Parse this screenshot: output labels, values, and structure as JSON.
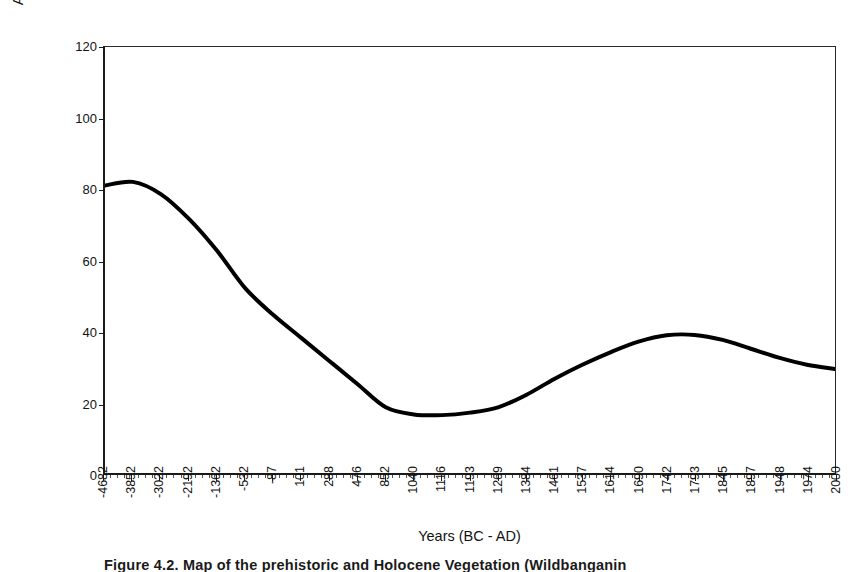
{
  "figure": {
    "caption": "Figure 4.2. Map of the prehistoric and Holocene Vegetation (Wildbanganin"
  },
  "chart_data": {
    "type": "line",
    "title": "",
    "xlabel": "Years (BC - AD)",
    "ylabel": "Arboreal/NonArboreal Pollen %",
    "ylim": [
      0,
      120
    ],
    "ytick_values": [
      0,
      20,
      40,
      60,
      80,
      100,
      120
    ],
    "ytick_labels": [
      "0",
      "20",
      "40",
      "60",
      "80",
      "100",
      "120"
    ],
    "grid": false,
    "legend": null,
    "line_color": "#000000",
    "line_width": 4,
    "categories": [
      "-4682",
      "-3852",
      "-3022",
      "-2192",
      "-1362",
      "-532",
      "-87",
      "101",
      "288",
      "476",
      "852",
      "1040",
      "1116",
      "1193",
      "1269",
      "1384",
      "1461",
      "1537",
      "1614",
      "1690",
      "1742",
      "1793",
      "1845",
      "1897",
      "1948",
      "1974",
      "2000"
    ],
    "series": [
      {
        "name": "Arboreal/NonArboreal Pollen %",
        "values": [
          81.0,
          82.0,
          78.5,
          71.5,
          62.5,
          52.0,
          44.5,
          38.0,
          31.5,
          25.0,
          18.5,
          16.5,
          16.3,
          17.0,
          18.5,
          22.0,
          26.5,
          30.5,
          34.0,
          37.0,
          38.8,
          38.9,
          37.5,
          35.0,
          32.5,
          30.5,
          29.3
        ]
      }
    ]
  }
}
